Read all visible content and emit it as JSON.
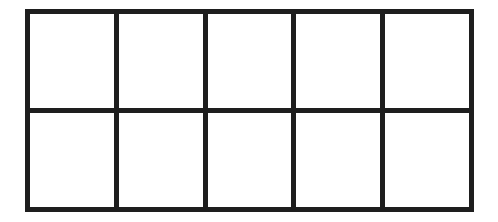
{
  "diagram": {
    "type": "grid",
    "rows": 2,
    "columns": 5,
    "line_color": "#1e1e1e",
    "background_color": "#ffffff",
    "cells": [
      {
        "row": 1,
        "col": 1,
        "text": ""
      },
      {
        "row": 1,
        "col": 2,
        "text": ""
      },
      {
        "row": 1,
        "col": 3,
        "text": ""
      },
      {
        "row": 1,
        "col": 4,
        "text": ""
      },
      {
        "row": 1,
        "col": 5,
        "text": ""
      },
      {
        "row": 2,
        "col": 1,
        "text": ""
      },
      {
        "row": 2,
        "col": 2,
        "text": ""
      },
      {
        "row": 2,
        "col": 3,
        "text": ""
      },
      {
        "row": 2,
        "col": 4,
        "text": ""
      },
      {
        "row": 2,
        "col": 5,
        "text": ""
      }
    ]
  }
}
